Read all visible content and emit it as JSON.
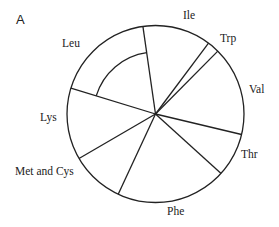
{
  "panel": {
    "label": "A"
  },
  "chart_data": {
    "type": "pie",
    "title": "",
    "panel_label": "A",
    "start_angle_deg_clockwise_from_top": -8.2,
    "categories": [
      "Ile",
      "Trp",
      "Val",
      "Thr",
      "Phe",
      "Met and Cys",
      "Lys",
      "Leu"
    ],
    "values": [
      12.5,
      2.2,
      16.3,
      8.0,
      20.2,
      9.7,
      13.1,
      18.0
    ],
    "units": "approximate percent of circle",
    "annotations": [
      {
        "type": "inner-arc",
        "slice": "Leu",
        "note": "concentric arc drawn inside Leu slice at ~70% radius"
      }
    ],
    "legend": "none (direct labels outside slices)",
    "style": {
      "stroke": "#222222",
      "fill": "#ffffff"
    }
  },
  "labels": {
    "ile": "Ile",
    "trp": "Trp",
    "val": "Val",
    "thr": "Thr",
    "phe": "Phe",
    "met_cys": "Met and Cys",
    "lys": "Lys",
    "leu": "Leu"
  }
}
